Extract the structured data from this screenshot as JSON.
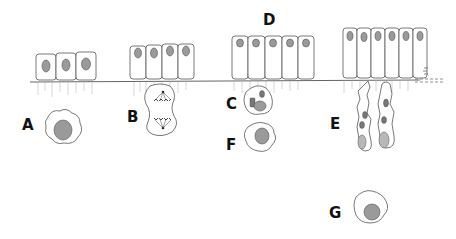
{
  "figure": {
    "labels": [
      {
        "id": "A",
        "text": "A",
        "x": 22,
        "y": 118
      },
      {
        "id": "B",
        "text": "B",
        "x": 127,
        "y": 110
      },
      {
        "id": "C",
        "text": "C",
        "x": 226,
        "y": 97
      },
      {
        "id": "D",
        "text": "D",
        "x": 263,
        "y": 13
      },
      {
        "id": "E",
        "text": "E",
        "x": 330,
        "y": 117
      },
      {
        "id": "F",
        "text": "F",
        "x": 226,
        "y": 138
      },
      {
        "id": "G",
        "text": "G",
        "x": 329,
        "y": 206
      }
    ],
    "epithelial_groups": [
      {
        "name": "cuboidal-group",
        "cell_count": 3
      },
      {
        "name": "low-columnar-group",
        "cell_count": 4
      },
      {
        "name": "columnar-group-D",
        "cell_count": 5
      },
      {
        "name": "tall-columnar-group",
        "cell_count": 6
      }
    ],
    "free_cells": [
      {
        "label": "A",
        "type": "round cell with large nucleus"
      },
      {
        "label": "B",
        "type": "dividing cell (mitotic spindle)"
      },
      {
        "label": "C",
        "type": "cell with granules"
      },
      {
        "label": "E",
        "type": "elongated migrating cells (pair)"
      },
      {
        "label": "F",
        "type": "round cell with large nucleus"
      },
      {
        "label": "G",
        "type": "round cell with large nucleus"
      }
    ]
  }
}
